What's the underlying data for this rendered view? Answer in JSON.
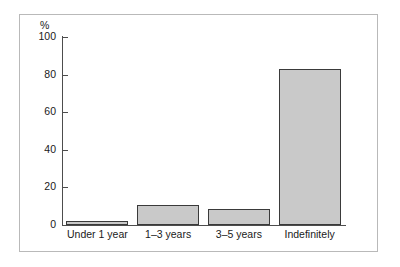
{
  "figure": {
    "background_color": "#ffffff",
    "frame_color": "#b9b9b9",
    "axis_color": "#4d4d4d",
    "bar_fill_color": "#c9c9c9",
    "bar_border_color": "#3a3a3a",
    "text_color": "#1a1a1a"
  },
  "chart_data": {
    "type": "bar",
    "title": "",
    "subtitle": "",
    "xlabel": "",
    "ylabel": "%",
    "categories": [
      "Under 1 year",
      "1–3 years",
      "3–5 years",
      "Indefinitely"
    ],
    "values": [
      2,
      10.5,
      8.5,
      83
    ],
    "ylim": [
      0,
      100
    ],
    "yticks": [
      0,
      20,
      40,
      60,
      80,
      100
    ],
    "ytick_labels": [
      "0",
      "20",
      "40",
      "60",
      "80",
      "100"
    ],
    "grid": false,
    "legend": null,
    "annotations": [],
    "series": [
      {
        "name": "",
        "values": [
          2,
          10.5,
          8.5,
          83
        ]
      }
    ]
  }
}
